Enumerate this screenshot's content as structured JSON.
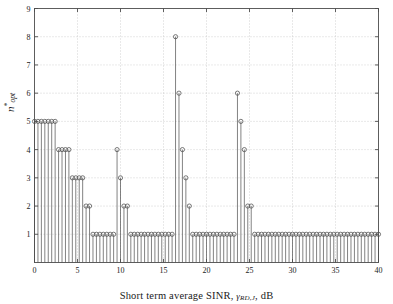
{
  "chart_data": {
    "type": "line",
    "style": "stem",
    "title": "",
    "xlabel": "Short term average SINR, γRD,J, dB",
    "xlabel_parts": {
      "prefix": "Short term average SINR, ",
      "symbol": "γ",
      "subscript": "RD,J",
      "suffix": ", dB"
    },
    "ylabel": "n*opt",
    "ylabel_parts": {
      "symbol": "n",
      "prime": "*",
      "subscript": "opt"
    },
    "xlim": [
      0,
      40
    ],
    "ylim": [
      0,
      9
    ],
    "xticks": [
      0,
      5,
      10,
      15,
      20,
      25,
      30,
      35,
      40
    ],
    "xticklabels": [
      "0",
      "5",
      "10",
      "15",
      "20",
      "25",
      "30",
      "35",
      "40"
    ],
    "yticks": [
      1,
      2,
      3,
      4,
      5,
      6,
      7,
      8,
      9
    ],
    "yticklabels": [
      "1",
      "2",
      "3",
      "4",
      "5",
      "6",
      "7",
      "8",
      "9"
    ],
    "grid": true,
    "grid_style": "dotted",
    "legend": null,
    "marker": "circle-open",
    "line_color": "#4d4d4d",
    "marker_color": "#4d4d4d",
    "axes_color": "#4d4d4d",
    "grid_color": "#b5b5b5",
    "background": "#ffffff",
    "x": [
      0.0,
      0.4,
      0.8,
      1.2,
      1.6,
      2.0,
      2.4,
      2.8,
      3.2,
      3.6,
      4.0,
      4.4,
      4.8,
      5.2,
      5.6,
      6.0,
      6.4,
      6.8,
      7.2,
      7.6,
      8.0,
      8.4,
      8.8,
      9.2,
      9.6,
      10.0,
      10.4,
      10.8,
      11.2,
      11.6,
      12.0,
      12.4,
      12.8,
      13.2,
      13.6,
      14.0,
      14.4,
      14.8,
      15.2,
      15.6,
      16.0,
      16.4,
      16.8,
      17.2,
      17.6,
      18.0,
      18.4,
      18.8,
      19.2,
      19.6,
      20.0,
      20.4,
      20.8,
      21.2,
      21.6,
      22.0,
      22.4,
      22.8,
      23.2,
      23.6,
      24.0,
      24.4,
      24.8,
      25.2,
      25.6,
      26.0,
      26.4,
      26.8,
      27.2,
      27.6,
      28.0,
      28.4,
      28.8,
      29.2,
      29.6,
      30.0,
      30.4,
      30.8,
      31.2,
      31.6,
      32.0,
      32.4,
      32.8,
      33.2,
      33.6,
      34.0,
      34.4,
      34.8,
      35.2,
      35.6,
      36.0,
      36.4,
      36.8,
      37.2,
      37.6,
      38.0,
      38.4,
      38.8,
      39.2,
      39.6,
      40.0
    ],
    "y": [
      5,
      5,
      5,
      5,
      5,
      5,
      5,
      4,
      4,
      4,
      4,
      3,
      3,
      3,
      3,
      2,
      2,
      1,
      1,
      1,
      1,
      1,
      1,
      1,
      4,
      3,
      2,
      2,
      1,
      1,
      1,
      1,
      1,
      1,
      1,
      1,
      1,
      1,
      1,
      1,
      1,
      8,
      6,
      4,
      3,
      2,
      1,
      1,
      1,
      1,
      1,
      1,
      1,
      1,
      1,
      1,
      1,
      1,
      1,
      6,
      5,
      4,
      2,
      2,
      1,
      1,
      1,
      1,
      1,
      1,
      1,
      1,
      1,
      1,
      1,
      1,
      1,
      1,
      1,
      1,
      1,
      1,
      1,
      1,
      1,
      1,
      1,
      1,
      1,
      1,
      1,
      1,
      1,
      1,
      1,
      1,
      1,
      1,
      1,
      1,
      1
    ],
    "ylabel_text": "n*_opt"
  },
  "figure": {
    "axis_label_x": "Short term average SINR, ",
    "axis_label_x_sym": "γ",
    "axis_label_x_sub": "RD,J",
    "axis_label_x_tail": ", dB",
    "axis_label_y_sym": "n",
    "axis_label_y_prime": "*",
    "axis_label_y_sub": "opt"
  }
}
